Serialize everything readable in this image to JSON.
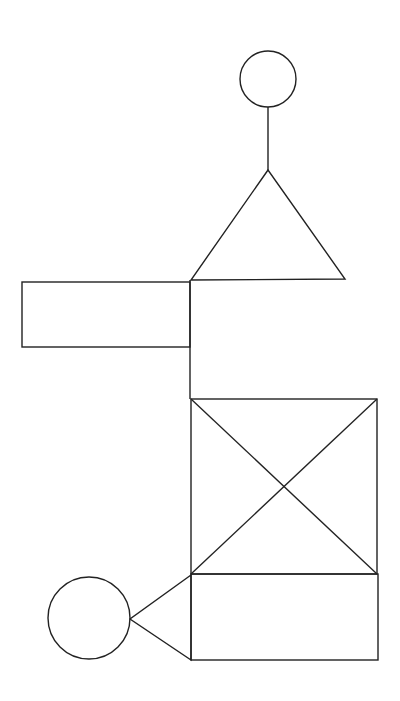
{
  "diagram": {
    "type": "line-drawing",
    "background": "#ffffff",
    "stroke_color": "#222222",
    "shapes": {
      "top_circle": {
        "cx": 268,
        "cy": 79,
        "r": 28
      },
      "top_connector": {
        "x1": 268,
        "y1": 107,
        "x2": 268,
        "y2": 170
      },
      "top_triangle": {
        "points": "268,170 191,280 345,279"
      },
      "left_rectangle": {
        "x": 22,
        "y": 282,
        "width": 168,
        "height": 65
      },
      "spine_line": {
        "x1": 190,
        "y1": 280,
        "x2": 190,
        "y2": 399
      },
      "x_box": {
        "x": 191,
        "y": 399,
        "width": 186,
        "height": 175
      },
      "x_box_diag1": {
        "x1": 191,
        "y1": 399,
        "x2": 377,
        "y2": 574
      },
      "x_box_diag2": {
        "x1": 377,
        "y1": 399,
        "x2": 191,
        "y2": 574
      },
      "bottom_rectangle": {
        "x": 191,
        "y": 574,
        "width": 187,
        "height": 86
      },
      "bottom_triangle": {
        "points": "191,575 130,619 191,660"
      },
      "bottom_circle": {
        "cx": 89,
        "cy": 618,
        "r": 41
      }
    }
  }
}
